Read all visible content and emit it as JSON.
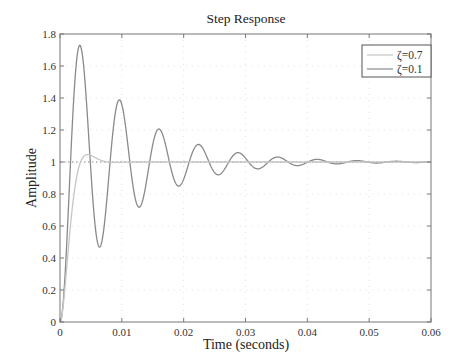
{
  "chart_data": {
    "type": "line",
    "title": "Step Response",
    "xlabel": "Time (seconds)",
    "ylabel": "Amplitude",
    "xlim": [
      0,
      0.06
    ],
    "ylim": [
      0,
      1.8
    ],
    "xticks": [
      0,
      0.01,
      0.02,
      0.03,
      0.04,
      0.05,
      0.06
    ],
    "xtick_labels": [
      "0",
      "0.01",
      "0.02",
      "0.03",
      "0.04",
      "0.05",
      "0.06"
    ],
    "yticks": [
      0,
      0.2,
      0.4,
      0.6,
      0.8,
      1,
      1.2,
      1.4,
      1.6,
      1.8
    ],
    "ytick_labels": [
      "0",
      "0.2",
      "0.4",
      "0.6",
      "0.8",
      "1",
      "1.2",
      "1.4",
      "1.6",
      "1.8"
    ],
    "grid": true,
    "legend_position": "upper right",
    "reference_line": {
      "y": 1,
      "style": "dotted"
    },
    "natural_frequency_rad_s": 987,
    "series": [
      {
        "name": "ζ=0.7",
        "damping": 0.7,
        "color": "#c6c6c6",
        "x": [
          0,
          0.001,
          0.002,
          0.003,
          0.004,
          0.005,
          0.006,
          0.008,
          0.01,
          0.015,
          0.02,
          0.03,
          0.04,
          0.05,
          0.06
        ],
        "values": [
          0,
          0.33,
          0.73,
          0.95,
          1.03,
          1.045,
          1.035,
          1.01,
          1.0,
          1.0,
          1.0,
          1.0,
          1.0,
          1.0,
          1.0
        ]
      },
      {
        "name": "ζ=0.1",
        "damping": 0.1,
        "color": "#8a8a8a",
        "peaks": [
          {
            "t": 0.0032,
            "y": 1.73
          },
          {
            "t": 0.0096,
            "y": 1.39
          },
          {
            "t": 0.016,
            "y": 1.2
          },
          {
            "t": 0.0224,
            "y": 1.11
          },
          {
            "t": 0.0288,
            "y": 1.06
          },
          {
            "t": 0.0352,
            "y": 1.03
          }
        ],
        "troughs": [
          {
            "t": 0.0064,
            "y": 0.47
          },
          {
            "t": 0.0128,
            "y": 0.72
          },
          {
            "t": 0.0192,
            "y": 0.85
          },
          {
            "t": 0.0256,
            "y": 0.92
          },
          {
            "t": 0.032,
            "y": 0.955
          }
        ],
        "final_value": 1.0
      }
    ]
  }
}
